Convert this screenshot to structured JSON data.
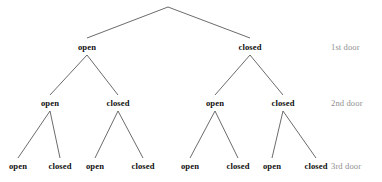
{
  "figure": {
    "type": "binary-decision-tree",
    "background_color": "#ffffff",
    "edge_color": "#5a5a5a",
    "node_text_color": "#111111",
    "level_label_color": "#909090",
    "width": 382,
    "height": 182
  },
  "chart_data": {
    "type": "diagram",
    "subtype": "binary-tree",
    "title": "",
    "depth": 3,
    "branch_labels": [
      "open",
      "closed"
    ],
    "level_labels": [
      "1st door",
      "2nd door",
      "3rd door"
    ],
    "leaf_count": 8
  },
  "root": {
    "x": 168,
    "y": 7
  },
  "levels": [
    {
      "index": 1,
      "label": "1st door",
      "label_x": 331,
      "y": 47,
      "nodes": [
        {
          "label": "open",
          "x": 87,
          "y": 47
        },
        {
          "label": "closed",
          "x": 250,
          "y": 47
        }
      ]
    },
    {
      "index": 2,
      "label": "2nd door",
      "label_x": 331,
      "y": 103,
      "nodes": [
        {
          "label": "open",
          "x": 50,
          "y": 103
        },
        {
          "label": "closed",
          "x": 118,
          "y": 103
        },
        {
          "label": "open",
          "x": 215,
          "y": 103
        },
        {
          "label": "closed",
          "x": 283,
          "y": 103
        }
      ]
    },
    {
      "index": 3,
      "label": "3rd door",
      "label_x": 331,
      "y": 166,
      "nodes": [
        {
          "label": "open",
          "x": 18,
          "y": 166
        },
        {
          "label": "closed",
          "x": 60,
          "y": 166
        },
        {
          "label": "open",
          "x": 95,
          "y": 166
        },
        {
          "label": "closed",
          "x": 143,
          "y": 166
        },
        {
          "label": "open",
          "x": 190,
          "y": 166
        },
        {
          "label": "closed",
          "x": 238,
          "y": 166
        },
        {
          "label": "open",
          "x": 272,
          "y": 166
        },
        {
          "label": "closed",
          "x": 316,
          "y": 166
        }
      ]
    }
  ],
  "edges": [
    {
      "x1": 168,
      "y1": 7,
      "x2": 87,
      "y2": 38,
      "from": "root",
      "to": "l1-open"
    },
    {
      "x1": 168,
      "y1": 7,
      "x2": 250,
      "y2": 38,
      "from": "root",
      "to": "l1-closed"
    },
    {
      "x1": 87,
      "y1": 55,
      "x2": 50,
      "y2": 95,
      "from": "l1-open",
      "to": "l2-open-1"
    },
    {
      "x1": 87,
      "y1": 55,
      "x2": 118,
      "y2": 95,
      "from": "l1-open",
      "to": "l2-closed-1"
    },
    {
      "x1": 250,
      "y1": 55,
      "x2": 215,
      "y2": 95,
      "from": "l1-closed",
      "to": "l2-open-2"
    },
    {
      "x1": 250,
      "y1": 55,
      "x2": 283,
      "y2": 95,
      "from": "l1-closed",
      "to": "l2-closed-2"
    },
    {
      "x1": 50,
      "y1": 111,
      "x2": 18,
      "y2": 158,
      "from": "l2-open-1",
      "to": "l3-open-1"
    },
    {
      "x1": 50,
      "y1": 111,
      "x2": 60,
      "y2": 158,
      "from": "l2-open-1",
      "to": "l3-closed-1"
    },
    {
      "x1": 118,
      "y1": 111,
      "x2": 95,
      "y2": 158,
      "from": "l2-closed-1",
      "to": "l3-open-2"
    },
    {
      "x1": 118,
      "y1": 111,
      "x2": 143,
      "y2": 158,
      "from": "l2-closed-1",
      "to": "l3-closed-2"
    },
    {
      "x1": 215,
      "y1": 111,
      "x2": 190,
      "y2": 158,
      "from": "l2-open-2",
      "to": "l3-open-3"
    },
    {
      "x1": 215,
      "y1": 111,
      "x2": 238,
      "y2": 158,
      "from": "l2-open-2",
      "to": "l3-closed-3"
    },
    {
      "x1": 283,
      "y1": 111,
      "x2": 272,
      "y2": 158,
      "from": "l2-closed-2",
      "to": "l3-open-4"
    },
    {
      "x1": 283,
      "y1": 111,
      "x2": 316,
      "y2": 158,
      "from": "l2-closed-2",
      "to": "l3-closed-4"
    }
  ]
}
